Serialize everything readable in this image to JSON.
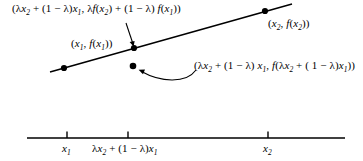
{
  "figure": {
    "name": "convexity-chord-diagram",
    "colors": {
      "ink": "#000000",
      "background": "#ffffff"
    },
    "labels": {
      "chord_point": {
        "text": "(λx₂ + (1 − λ)x₁, λf(x₂) + (1 − λ) f(x₁))",
        "parts": {
          "open": "(",
          "lambda": "λ",
          "x": "x",
          "sub2": "2",
          "plus": " + ",
          "one_minus_lambda": "(1 − λ)",
          "sub1": "1",
          "comma": ", ",
          "f": "f",
          "close": ")"
        }
      },
      "right_point": {
        "text": "(x₂, f(x₂))"
      },
      "left_point": {
        "text": "(x₁, f(x₁))"
      },
      "curve_point": {
        "text": "(λx₂ + (1 − λ) x₁, f(λx₂ + ( 1 − λ)x₁))"
      }
    },
    "axis": {
      "ticks": [
        {
          "name": "x1",
          "text": "x₁"
        },
        {
          "name": "mid",
          "text": "λx₂ + (1 − λ)x₁"
        },
        {
          "name": "x2",
          "text": "x₂"
        }
      ]
    }
  }
}
